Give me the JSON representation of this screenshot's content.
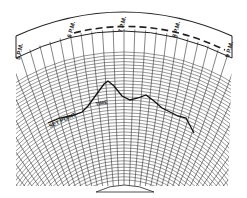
{
  "diagram": {
    "type": "recording-chart-paper",
    "time_labels": [
      "5 P.M.",
      "6 P.M.",
      "7 P.M.",
      "8 P.M.",
      "9 P.M."
    ],
    "annotations": {
      "set_point": "SET POINT",
      "time": "TIME"
    },
    "colors": {
      "ink": "#222222",
      "paper": "#ffffff"
    }
  }
}
